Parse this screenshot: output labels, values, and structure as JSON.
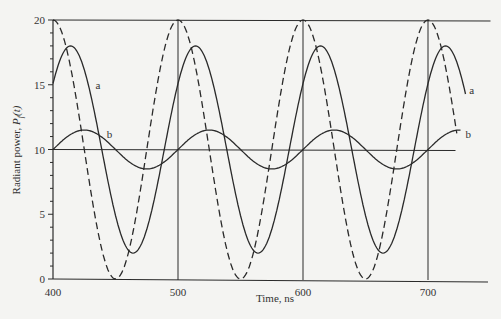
{
  "chart_data": {
    "type": "line",
    "title": "",
    "xlabel": "Time, ns",
    "ylabel": "Radiant power, P_f(t)",
    "ylabel_parts": {
      "main": "Radiant power, ",
      "var": "P",
      "sub": "f",
      "arg": "(t)"
    },
    "xlim": [
      400,
      740
    ],
    "ylim": [
      0,
      20
    ],
    "x_ticks": [
      400,
      500,
      600,
      700
    ],
    "y_ticks": [
      0,
      5,
      10,
      15,
      20
    ],
    "y_minor_step": 1,
    "grid": false,
    "reference_lines": {
      "horizontal": [
        {
          "y": 20,
          "x_end": 750
        },
        {
          "y": 10,
          "x_end": 722
        }
      ],
      "vertical": [
        500,
        600,
        700
      ]
    },
    "series": [
      {
        "name": "excitation (dashed)",
        "style": "dashed",
        "model": "10 + 10*cos(2*pi*(t-400)/100)",
        "offset": 10,
        "amplitude": 10,
        "period": 100,
        "peak_at": 400,
        "x_range": [
          400,
          723
        ],
        "peaks": [
          [
            400,
            20
          ],
          [
            500,
            20
          ],
          [
            600,
            20
          ],
          [
            700,
            20
          ]
        ],
        "troughs": [
          [
            450,
            0
          ],
          [
            550,
            0
          ],
          [
            650,
            0
          ]
        ]
      },
      {
        "name": "a",
        "label": "a",
        "style": "solid",
        "model": "10 + 8*cos(2*pi*(t-414)/100)",
        "offset": 10,
        "amplitude": 8,
        "period": 100,
        "peak_at": 414,
        "x_range": [
          400,
          730
        ],
        "peaks": [
          [
            414,
            18
          ],
          [
            514,
            18
          ],
          [
            614,
            18
          ],
          [
            714,
            18
          ]
        ],
        "troughs": [
          [
            464,
            2
          ],
          [
            564,
            2
          ],
          [
            664,
            2
          ]
        ],
        "label_pos": [
          [
            434,
            15
          ],
          [
            733,
            14.6
          ]
        ]
      },
      {
        "name": "b",
        "label": "b",
        "style": "solid",
        "model": "10 + 1.5*sin(2*pi*(t-400)/100)",
        "offset": 10,
        "amplitude": 1.5,
        "period": 100,
        "peak_at": 425,
        "x_range": [
          400,
          726
        ],
        "peaks": [
          [
            425,
            11.5
          ],
          [
            525,
            11.5
          ],
          [
            625,
            11.5
          ],
          [
            725,
            11.5
          ]
        ],
        "troughs": [
          [
            475,
            8.5
          ],
          [
            575,
            8.5
          ],
          [
            675,
            8.5
          ]
        ],
        "label_pos": [
          [
            443,
            11.2
          ],
          [
            730,
            11.2
          ]
        ]
      }
    ]
  }
}
